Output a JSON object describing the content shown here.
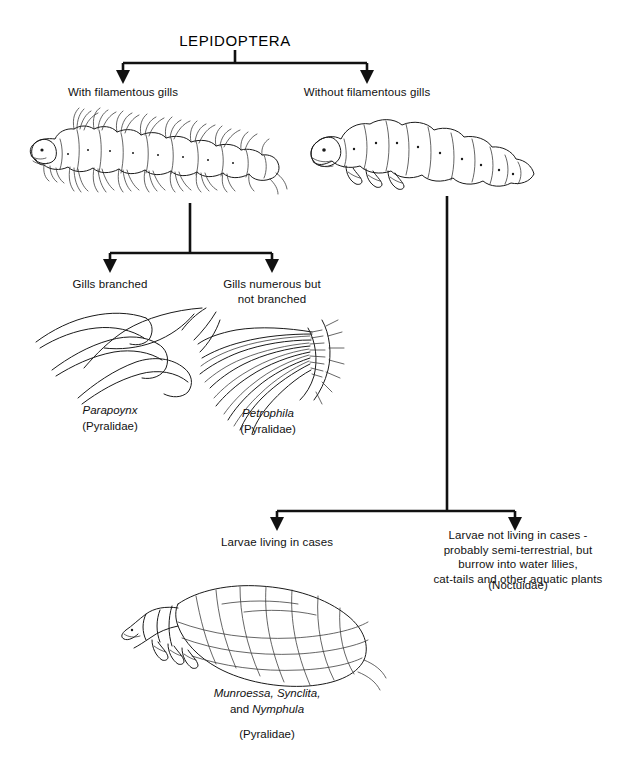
{
  "diagram": {
    "title": "LEPIDOPTERA",
    "type": "dichotomous-key",
    "branches": {
      "level1_left": "With filamentous gills",
      "level1_right": "Without filamentous gills",
      "level2_left": "Gills branched",
      "level2_right": "Gills numerous but\nnot branched",
      "level3_left": "Larvae living in cases",
      "level3_right": "Larvae not living in cases -\nprobably semi-terrestrial, but\nburrow into water lilies,\ncat-tails and other aquatic plants"
    },
    "captions": {
      "parapoynx_genus": "Parapoynx",
      "parapoynx_family": "(Pyralidae)",
      "petrophila_genus": "Petrophila",
      "petrophila_family": "(Pyralidae)",
      "noctuidae_family": "(Noctuidae)",
      "case_genera_line1": "Munroessa, Synclita,",
      "case_genera_line2_prefix": "and ",
      "case_genera_line2_genus": "Nymphula",
      "case_family": "(Pyralidae)"
    },
    "figures": {
      "gilled_larva": "gilled-caterpillar-illustration",
      "smooth_larva": "smooth-caterpillar-illustration",
      "branched_gill": "branched-gill-detail-illustration",
      "numerous_gill": "numerous-unbranched-gill-detail-illustration",
      "case_larva": "larva-in-leaf-case-illustration"
    },
    "colors": {
      "ink": "#1a1a1a",
      "line": "#111111",
      "background": "#ffffff"
    }
  }
}
